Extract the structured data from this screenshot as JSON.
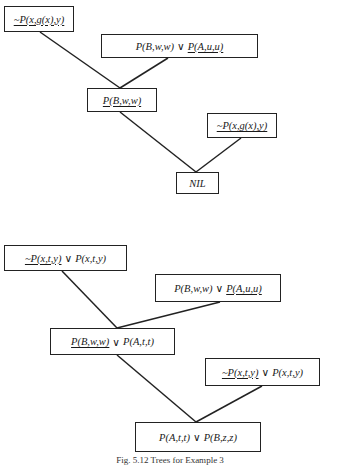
{
  "trees": [
    {
      "id": "top",
      "nodes": [
        {
          "id": "t1",
          "parts": [
            {
              "text": "~P(x,g(x),y)",
              "underline": true
            }
          ]
        },
        {
          "id": "t2",
          "parts": [
            {
              "text": "P(B,w,w)",
              "underline": false
            },
            {
              "text": "∨",
              "op": true
            },
            {
              "text": "P(A,u,u)",
              "underline": true
            }
          ]
        },
        {
          "id": "t3",
          "parts": [
            {
              "text": "P(B,w,w)",
              "underline": true
            }
          ]
        },
        {
          "id": "t4",
          "parts": [
            {
              "text": "~P(x,g(x),y)",
              "underline": true
            }
          ]
        },
        {
          "id": "t5",
          "parts": [
            {
              "text": "NIL",
              "underline": false
            }
          ]
        }
      ],
      "edges": [
        [
          "t1",
          "t3"
        ],
        [
          "t2",
          "t3"
        ],
        [
          "t3",
          "t5"
        ],
        [
          "t4",
          "t5"
        ]
      ]
    },
    {
      "id": "bottom",
      "nodes": [
        {
          "id": "b1",
          "parts": [
            {
              "text": "~P(x,t,y)",
              "underline": true
            },
            {
              "text": "∨",
              "op": true
            },
            {
              "text": "P(x,t,y)",
              "underline": false
            }
          ]
        },
        {
          "id": "b2",
          "parts": [
            {
              "text": "P(B,w,w)",
              "underline": false
            },
            {
              "text": "∨",
              "op": true
            },
            {
              "text": "P(A,u,u)",
              "underline": true
            }
          ]
        },
        {
          "id": "b3",
          "parts": [
            {
              "text": "P(B,w,w)",
              "underline": true
            },
            {
              "text": "∨",
              "op": true
            },
            {
              "text": "P(A,t,t)",
              "underline": false
            }
          ]
        },
        {
          "id": "b4",
          "parts": [
            {
              "text": "~P(x,t,y)",
              "underline": true
            },
            {
              "text": "∨",
              "op": true
            },
            {
              "text": "P(x,t,y)",
              "underline": false
            }
          ]
        },
        {
          "id": "b5",
          "parts": [
            {
              "text": "P(A,t,t)",
              "underline": false
            },
            {
              "text": "∨",
              "op": true
            },
            {
              "text": "P(B,z,z)",
              "underline": false
            }
          ]
        }
      ],
      "edges": [
        [
          "b1",
          "b3"
        ],
        [
          "b2",
          "b3"
        ],
        [
          "b3",
          "b5"
        ],
        [
          "b4",
          "b5"
        ]
      ]
    }
  ],
  "labels": {
    "t1": {
      "a": "~P(x,g(x),y)"
    },
    "t2": {
      "a": "P(B,w,w)",
      "op": "∨",
      "b": "P(A,u,u)"
    },
    "t3": {
      "a": "P(B,w,w)"
    },
    "t4": {
      "a": "~P(x,g(x),y)"
    },
    "t5": {
      "a": "NIL"
    },
    "b1": {
      "a": "~P(x,t,y)",
      "op": "∨",
      "b": "P(x,t,y)"
    },
    "b2": {
      "a": "P(B,w,w)",
      "op": "∨",
      "b": "P(A,u,u)"
    },
    "b3": {
      "a": "P(B,w,w)",
      "op": "∨",
      "b": "P(A,t,t)"
    },
    "b4": {
      "a": "~P(x,t,y)",
      "op": "∨",
      "b": "P(x,t,y)"
    },
    "b5": {
      "a": "P(A,t,t)",
      "op": "∨",
      "b": "P(B,z,z)"
    }
  },
  "caption": "Fig. 5.12 Trees for Example 3"
}
